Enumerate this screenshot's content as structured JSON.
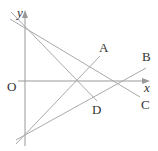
{
  "diagram": {
    "axes": {
      "x_label": "x",
      "y_label": "y",
      "origin_label": "O"
    },
    "lines": [
      {
        "label": "A",
        "description": "line through lower y-intercept rising steeply to upper right"
      },
      {
        "label": "B",
        "description": "line through lower y-intercept rising gently to right"
      },
      {
        "label": "C",
        "description": "line through upper y-intercept descending gently to right"
      },
      {
        "label": "D",
        "description": "line through upper y-intercept descending steeply to right"
      }
    ],
    "colors": {
      "axis": "#999999",
      "line": "#aaaaaa",
      "text": "#333333"
    }
  }
}
